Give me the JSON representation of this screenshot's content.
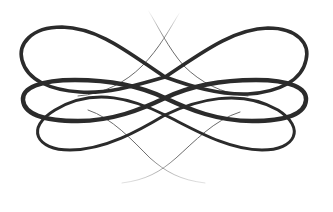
{
  "image": {
    "kind": "decorative-flourish-ornament",
    "description": "Symmetric calligraphic swirl ornament with three interlaced horizontal loops and thin crossing hairline strands",
    "colors": {
      "background": "#ffffff",
      "stroke": "#2b2b2b",
      "hairline": "#6a6a6a",
      "baseline": "#d8d8d8"
    }
  }
}
